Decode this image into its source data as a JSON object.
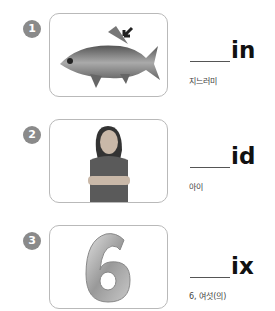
{
  "items": [
    {
      "number": "1",
      "image": "fish (crucian carp) with arrow pointing to dorsal fin",
      "suffix": "in",
      "meaning": "지느러미"
    },
    {
      "number": "2",
      "image": "girl with crossed arms",
      "suffix": "id",
      "meaning": "아이"
    },
    {
      "number": "3",
      "image": "silver number 6 balloon",
      "suffix": "ix",
      "meaning": "6, 여섯(의)"
    }
  ]
}
